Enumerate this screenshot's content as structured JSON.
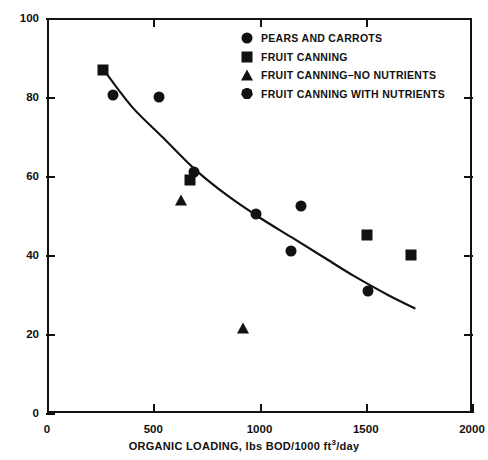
{
  "chart_data": {
    "type": "scatter",
    "title": "",
    "xlabel": "ORGANIC LOADING, lbs BOD/1000 ft3/day",
    "xlabel_parts": {
      "pre": "ORGANIC LOADING, lbs BOD/1000 ft",
      "sup": "3",
      "post": "/day"
    },
    "ylabel": "BOD REMOVAL, percent",
    "xlim": [
      0,
      2000
    ],
    "ylim": [
      0,
      100
    ],
    "xticks": [
      0,
      500,
      1000,
      1500,
      2000
    ],
    "yticks": [
      0,
      20,
      40,
      60,
      80,
      100
    ],
    "xtick_labels": [
      "0",
      "500",
      "1000",
      "1500",
      "2000"
    ],
    "ytick_labels": [
      "0",
      "20",
      "40",
      "60",
      "80",
      "100"
    ],
    "grid": false,
    "legend_position": "top-right",
    "marker_color": "#111111",
    "curve_color": "#111111",
    "series": [
      {
        "name": "PEARS AND CARROTS",
        "marker": "circle",
        "points": [
          {
            "x": 310,
            "y": 80.5
          },
          {
            "x": 525,
            "y": 80.0
          },
          {
            "x": 690,
            "y": 61.0
          },
          {
            "x": 985,
            "y": 50.5
          },
          {
            "x": 1150,
            "y": 41.0
          },
          {
            "x": 1195,
            "y": 52.5
          },
          {
            "x": 1510,
            "y": 31.0
          }
        ]
      },
      {
        "name": "FRUIT CANNING",
        "marker": "square",
        "points": [
          {
            "x": 265,
            "y": 86.8
          },
          {
            "x": 672,
            "y": 59.0
          },
          {
            "x": 1505,
            "y": 45.0
          },
          {
            "x": 1715,
            "y": 40.0
          }
        ]
      },
      {
        "name": "FRUIT CANNING–NO NUTRIENTS",
        "marker": "triangle",
        "points": [
          {
            "x": 630,
            "y": 54.0
          },
          {
            "x": 922,
            "y": 21.5
          }
        ]
      },
      {
        "name": "FRUIT CANNING WITH NUTRIENTS",
        "marker": "heptagon",
        "points": []
      }
    ],
    "fit_curve": {
      "name": "trend",
      "points": [
        {
          "x": 265,
          "y": 87.0
        },
        {
          "x": 400,
          "y": 77.5
        },
        {
          "x": 550,
          "y": 69.5
        },
        {
          "x": 700,
          "y": 61.5
        },
        {
          "x": 850,
          "y": 55.0
        },
        {
          "x": 1000,
          "y": 49.5
        },
        {
          "x": 1150,
          "y": 44.5
        },
        {
          "x": 1300,
          "y": 39.5
        },
        {
          "x": 1450,
          "y": 34.5
        },
        {
          "x": 1600,
          "y": 30.0
        },
        {
          "x": 1730,
          "y": 26.5
        }
      ]
    }
  },
  "legend": {
    "items": [
      {
        "label": "PEARS AND CARROTS",
        "marker": "circle"
      },
      {
        "label": "FRUIT CANNING",
        "marker": "square"
      },
      {
        "label": "FRUIT CANNING–NO NUTRIENTS",
        "marker": "triangle"
      },
      {
        "label": "FRUIT CANNING WITH NUTRIENTS",
        "marker": "heptagon"
      }
    ]
  }
}
